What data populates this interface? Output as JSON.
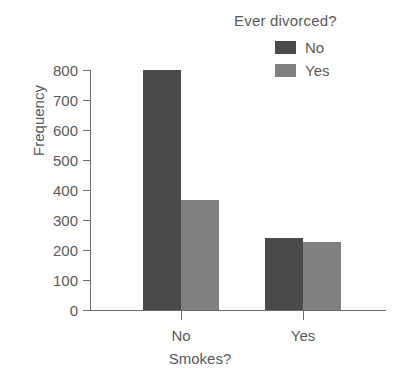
{
  "chart_data": {
    "type": "bar",
    "title": "",
    "xlabel": "Smokes?",
    "ylabel": "Frequency",
    "categories": [
      "No",
      "Yes"
    ],
    "series": [
      {
        "name": "No",
        "values": [
          800,
          240
        ],
        "color": "#4a4a4a"
      },
      {
        "name": "Yes",
        "values": [
          367,
          228
        ],
        "color": "#808080"
      }
    ],
    "legend": {
      "title": "Ever divorced?",
      "position": "top-right",
      "entries": [
        {
          "label": "No",
          "color": "#4a4a4a"
        },
        {
          "label": "Yes",
          "color": "#808080"
        }
      ]
    },
    "ylim": [
      0,
      800
    ],
    "yticks": [
      0,
      100,
      200,
      300,
      400,
      500,
      600,
      700,
      800
    ],
    "ytick_labels": [
      "0",
      "100",
      "200",
      "300",
      "400",
      "500",
      "600",
      "700",
      "800"
    ],
    "xtick_labels": [
      "No",
      "Yes"
    ],
    "grid": false,
    "axis_color": "#6d6d6f",
    "text_color": "#59595b",
    "background": "#ffffff"
  }
}
